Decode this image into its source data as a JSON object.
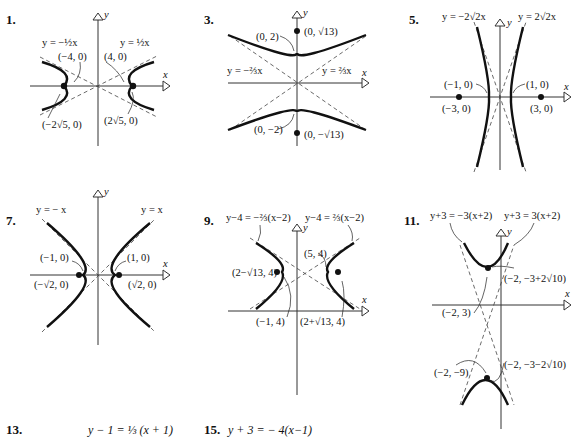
{
  "problems": [
    {
      "number": "1.",
      "asymptotes": [
        "y = −½x",
        "y = ½x"
      ],
      "vertices": [
        "(−4, 0)",
        "(4, 0)"
      ],
      "foci": [
        "(−2√5, 0)",
        "(2√5, 0)"
      ],
      "axis_labels": {
        "x": "x",
        "y": "y"
      }
    },
    {
      "number": "3.",
      "asymptotes": [
        "y = −⅔x",
        "y = ⅔x"
      ],
      "vertices": [
        "(0, 2)",
        "(0, −2)"
      ],
      "foci": [
        "(0, √13)",
        "(0, −√13)"
      ],
      "axis_labels": {
        "x": "x",
        "y": "y"
      }
    },
    {
      "number": "5.",
      "asymptotes": [
        "y = −2√2x",
        "y = 2√2x"
      ],
      "vertices": [
        "(−1, 0)",
        "(1, 0)"
      ],
      "foci": [
        "(−3, 0)",
        "(3, 0)"
      ],
      "axis_labels": {
        "x": "x",
        "y": "y"
      }
    },
    {
      "number": "7.",
      "asymptotes": [
        "y = − x",
        "y = x"
      ],
      "vertices": [
        "(−1, 0)",
        "(1, 0)"
      ],
      "foci": [
        "(−√2, 0)",
        "(√2, 0)"
      ],
      "axis_labels": {
        "x": "x",
        "y": "y"
      }
    },
    {
      "number": "9.",
      "asymptotes": [
        "y−4 = −⅔(x−2)",
        "y−4 = ⅔(x−2)"
      ],
      "vertices": [
        "(−1, 4)",
        "(5, 4)"
      ],
      "foci": [
        "(2−√13, 4)",
        "(2+√13, 4)"
      ],
      "axis_labels": {
        "x": "x",
        "y": "y"
      }
    },
    {
      "number": "11.",
      "asymptotes": [
        "y+3 = −3(x+2)",
        "y+3 = 3(x+2)"
      ],
      "vertices": [
        "(−2, 3)",
        "(−2, −9)"
      ],
      "foci": [
        "(−2, −3+2√10)",
        "(−2, −3−2√10)"
      ],
      "axis_labels": {
        "x": "x",
        "y": "y"
      }
    }
  ],
  "answers": [
    {
      "number": "13.",
      "equation": "y − 1 = ⅓ (x + 1)"
    },
    {
      "number": "15.",
      "equation": "y + 3 = − 4(x−1)"
    }
  ]
}
